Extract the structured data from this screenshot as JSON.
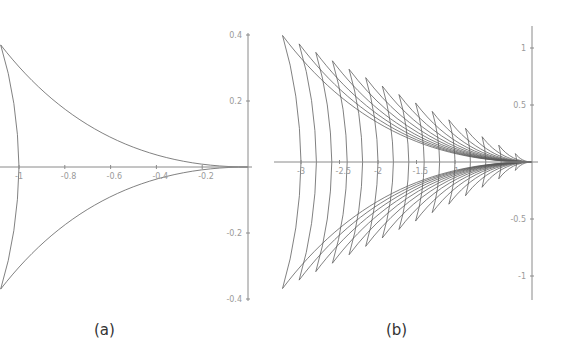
{
  "figure": {
    "captions": {
      "a": "(a)",
      "b": "(b)"
    }
  },
  "chart_data": [
    {
      "panel": "a",
      "type": "line",
      "title": "",
      "caption": "(a)",
      "description": "Single deltoid-like closed curve with cusps at the origin and at upper/lower left corners",
      "xlabel": "",
      "ylabel": "",
      "xlim": [
        -1.09,
        0.02
      ],
      "ylim": [
        -0.4,
        0.4
      ],
      "x_ticks": [
        -1,
        -0.8,
        -0.6,
        -0.4,
        -0.2
      ],
      "x_tick_labels": [
        "-1",
        "-0.8",
        "-0.6",
        "-0.4",
        "-0.2"
      ],
      "y_ticks": [
        0.4,
        0.2,
        -0.2,
        -0.4
      ],
      "y_tick_labels": [
        "0.4",
        "0.2",
        "-0.2",
        "-0.4"
      ],
      "grid": false,
      "scales": [
        1.0
      ],
      "cusps": [
        [
          0,
          0
        ],
        [
          -1.08,
          0.37
        ],
        [
          -1.08,
          -0.37
        ]
      ],
      "left_arc_x_intercept": -1.0
    },
    {
      "panel": "b",
      "type": "line",
      "title": "",
      "caption": "(b)",
      "description": "Family of 15 scaled deltoid-like curves sharing the cusp at the origin",
      "xlabel": "",
      "ylabel": "",
      "xlim": [
        -3.3,
        0.1
      ],
      "ylim": [
        -1.2,
        1.2
      ],
      "x_ticks": [
        -3,
        -2.5,
        -2,
        -1.5,
        -1
      ],
      "x_tick_labels": [
        "-3",
        "-2.5",
        "-2",
        "-1.5",
        "-1"
      ],
      "y_ticks": [
        1,
        0.5,
        -0.5,
        -1
      ],
      "y_tick_labels": [
        "1",
        "0.5",
        "-0.5",
        "-1"
      ],
      "grid": false,
      "scales": [
        0.2,
        0.4,
        0.6,
        0.8,
        1.0,
        1.2,
        1.4,
        1.6,
        1.8,
        2.0,
        2.2,
        2.4,
        2.6,
        2.8,
        3.0
      ],
      "cusp_shape": {
        "cusp_x_factor": 1.08,
        "cusp_y_factor": 0.37,
        "arc_x_intercept_factor": 1.0
      }
    }
  ]
}
